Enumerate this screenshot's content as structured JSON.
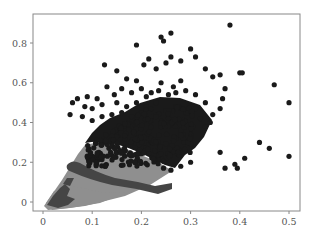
{
  "chart_data": {
    "type": "scatter",
    "title": "",
    "xlabel": "",
    "ylabel": "",
    "xlim": [
      -0.01,
      0.52
    ],
    "ylim": [
      -0.05,
      0.95
    ],
    "grid": false,
    "legend": null,
    "xticks": [
      0,
      0.1,
      0.2,
      0.3,
      0.4,
      0.5
    ],
    "xtick_labels": [
      "0",
      "0.1",
      "0.2",
      "0.3",
      "0.4",
      "0.5"
    ],
    "yticks": [
      0,
      0.2,
      0.4,
      0.6,
      0.8
    ],
    "ytick_labels": [
      "0",
      "0.2",
      "0.4",
      "0.6",
      "0.8"
    ],
    "series": [
      {
        "name": "cluster-high",
        "color": "#1a1a1a",
        "description": "dense dark cluster upper region, x 0.05-0.35, y 0.15-0.9",
        "points": [
          [
            0.38,
            0.89
          ],
          [
            0.26,
            0.85
          ],
          [
            0.24,
            0.83
          ],
          [
            0.245,
            0.81
          ],
          [
            0.19,
            0.79
          ],
          [
            0.3,
            0.77
          ],
          [
            0.215,
            0.72
          ],
          [
            0.26,
            0.73
          ],
          [
            0.28,
            0.71
          ],
          [
            0.31,
            0.73
          ],
          [
            0.25,
            0.7
          ],
          [
            0.205,
            0.69
          ],
          [
            0.4,
            0.65
          ],
          [
            0.405,
            0.65
          ],
          [
            0.345,
            0.63
          ],
          [
            0.36,
            0.64
          ],
          [
            0.17,
            0.62
          ],
          [
            0.19,
            0.61
          ],
          [
            0.24,
            0.6
          ],
          [
            0.28,
            0.61
          ],
          [
            0.125,
            0.69
          ],
          [
            0.15,
            0.66
          ],
          [
            0.23,
            0.67
          ],
          [
            0.33,
            0.67
          ],
          [
            0.47,
            0.59
          ],
          [
            0.5,
            0.5
          ],
          [
            0.37,
            0.57
          ],
          [
            0.365,
            0.52
          ],
          [
            0.36,
            0.47
          ],
          [
            0.345,
            0.44
          ],
          [
            0.33,
            0.5
          ],
          [
            0.31,
            0.54
          ],
          [
            0.29,
            0.56
          ],
          [
            0.27,
            0.55
          ],
          [
            0.265,
            0.58
          ],
          [
            0.255,
            0.54
          ],
          [
            0.235,
            0.56
          ],
          [
            0.22,
            0.55
          ],
          [
            0.2,
            0.57
          ],
          [
            0.21,
            0.53
          ],
          [
            0.18,
            0.55
          ],
          [
            0.16,
            0.57
          ],
          [
            0.145,
            0.54
          ],
          [
            0.13,
            0.58
          ],
          [
            0.11,
            0.52
          ],
          [
            0.09,
            0.53
          ],
          [
            0.07,
            0.52
          ],
          [
            0.085,
            0.48
          ],
          [
            0.1,
            0.47
          ],
          [
            0.12,
            0.49
          ],
          [
            0.29,
            0.45
          ],
          [
            0.31,
            0.47
          ],
          [
            0.27,
            0.48
          ],
          [
            0.32,
            0.42
          ],
          [
            0.34,
            0.4
          ],
          [
            0.33,
            0.38
          ],
          [
            0.36,
            0.25
          ],
          [
            0.44,
            0.3
          ],
          [
            0.46,
            0.27
          ],
          [
            0.5,
            0.23
          ],
          [
            0.41,
            0.22
          ],
          [
            0.39,
            0.19
          ],
          [
            0.395,
            0.17
          ],
          [
            0.37,
            0.17
          ],
          [
            0.275,
            0.24
          ],
          [
            0.3,
            0.2
          ],
          [
            0.28,
            0.18
          ],
          [
            0.26,
            0.16
          ],
          [
            0.3,
            0.34
          ],
          [
            0.28,
            0.36
          ],
          [
            0.29,
            0.3
          ],
          [
            0.27,
            0.32
          ],
          [
            0.25,
            0.22
          ],
          [
            0.245,
            0.17
          ],
          [
            0.24,
            0.38
          ],
          [
            0.26,
            0.4
          ],
          [
            0.23,
            0.44
          ],
          [
            0.22,
            0.41
          ],
          [
            0.2,
            0.45
          ],
          [
            0.18,
            0.43
          ],
          [
            0.16,
            0.45
          ],
          [
            0.14,
            0.44
          ],
          [
            0.12,
            0.43
          ],
          [
            0.1,
            0.41
          ],
          [
            0.08,
            0.43
          ],
          [
            0.15,
            0.5
          ],
          [
            0.17,
            0.48
          ],
          [
            0.19,
            0.5
          ],
          [
            0.21,
            0.48
          ],
          [
            0.23,
            0.5
          ],
          [
            0.25,
            0.46
          ],
          [
            0.06,
            0.5
          ],
          [
            0.055,
            0.44
          ]
        ],
        "dense_region": {
          "x": [
            0.09,
            0.31
          ],
          "y": [
            0.18,
            0.48
          ]
        }
      },
      {
        "name": "band-light",
        "color": "#8f8f8f",
        "description": "light gray fan band, x 0.01-0.2, y 0-0.34"
      },
      {
        "name": "band-dark",
        "color": "#454545",
        "description": "dark gray curved bands at lower region, x 0.02-0.18"
      }
    ]
  }
}
